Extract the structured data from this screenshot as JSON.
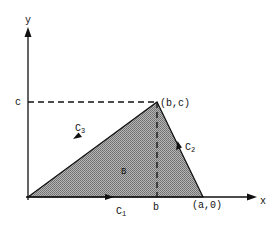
{
  "diagram": {
    "type": "region-with-boundary-curves",
    "axes": {
      "x_label": "x",
      "y_label": "y"
    },
    "points": {
      "origin": [
        0,
        0
      ],
      "apex": "(b,c)",
      "right_vertex": "(a,0)"
    },
    "tick_labels": {
      "c": "c",
      "b": "b"
    },
    "vertex_labels": {
      "apex": "(b,c)",
      "right": "(a,0)"
    },
    "region_label": "B",
    "curves": [
      {
        "name": "C",
        "sub": "1",
        "from": "(0,0)",
        "to": "(a,0)",
        "direction": "right"
      },
      {
        "name": "C",
        "sub": "2",
        "from": "(a,0)",
        "to": "(b,c)",
        "direction": "up-left"
      },
      {
        "name": "C",
        "sub": "3",
        "from": "(b,c)",
        "to": "(0,0)",
        "direction": "down-left"
      }
    ],
    "colors": {
      "fill": "#9a9a9a",
      "stroke": "#111111",
      "background": "#ffffff"
    }
  }
}
